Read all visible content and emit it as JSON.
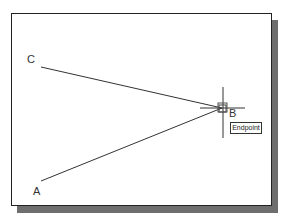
{
  "canvas": {
    "points": [
      {
        "name": "C",
        "label": "C",
        "x": 41,
        "y": 67
      },
      {
        "name": "A",
        "label": "A",
        "x": 41,
        "y": 181
      },
      {
        "name": "B",
        "label": "B",
        "x": 222,
        "y": 108
      }
    ],
    "lines": [
      {
        "from": "C",
        "to": "B"
      },
      {
        "from": "A",
        "to": "B"
      }
    ]
  },
  "cursor": {
    "x": 222,
    "y": 108,
    "snap_marker": "endpoint-square"
  },
  "tooltip": {
    "text": "Endpoint"
  },
  "colors": {
    "line": "#333333",
    "frame": "#222222",
    "shadow": "#6e6e6e",
    "background": "#ffffff"
  }
}
